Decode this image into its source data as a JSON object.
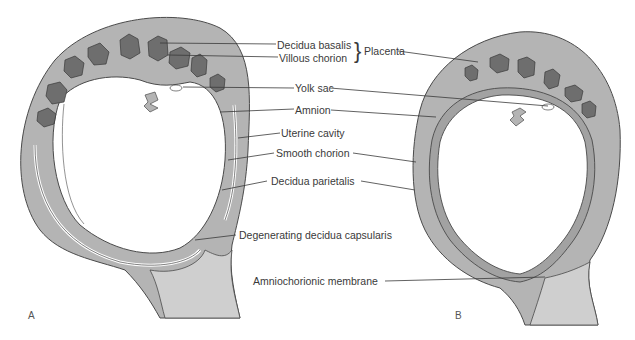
{
  "colors": {
    "decidua": "#b4b4b4",
    "villi": "#6e6e6e",
    "outline": "#4a4a4a",
    "cervix_light": "#cfcfcf",
    "cavity": "#ffffff",
    "leader": "#3a3a3a"
  },
  "labels": {
    "decidua_basalis": "Decidua basalis",
    "villous_chorion": "Villous chorion",
    "placenta": "Placenta",
    "brace": "}",
    "yolk_sac": "Yolk sac",
    "amnion": "Amnion",
    "uterine_cavity": "Uterine cavity",
    "smooth_chorion": "Smooth chorion",
    "decidua_parietalis": "Decidua parietalis",
    "degenerating_decidua_capsularis": "Degenerating decidua capsularis",
    "amniochorionic_membrane": "Amniochorionic membrane"
  },
  "panels": {
    "a": "A",
    "b": "B"
  }
}
